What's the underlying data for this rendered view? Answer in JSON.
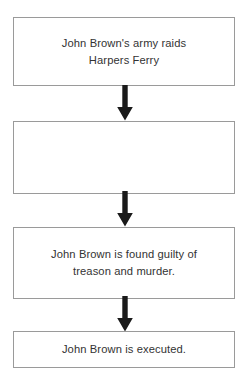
{
  "diagram": {
    "type": "vertical-flowchart",
    "orientation": "top-to-bottom",
    "background_color": "#ffffff",
    "box_border_color": "#9a9a9a",
    "text_color": "#333333",
    "arrow_color": "#1a1a1a",
    "nodes": [
      {
        "id": "node-1",
        "order": 1,
        "text": "John Brown's army raids\nHarpers Ferry",
        "empty": false
      },
      {
        "id": "node-2",
        "order": 2,
        "text": "",
        "empty": true
      },
      {
        "id": "node-3",
        "order": 3,
        "text": "John Brown is found guilty of\ntreason and murder.",
        "empty": false
      },
      {
        "id": "node-4",
        "order": 4,
        "text": "John Brown is executed.",
        "empty": false
      }
    ],
    "connectors": [
      {
        "id": "arrow-1",
        "from": "node-1",
        "to": "node-2",
        "icon": "arrow-down-icon"
      },
      {
        "id": "arrow-2",
        "from": "node-2",
        "to": "node-3",
        "icon": "arrow-down-icon"
      },
      {
        "id": "arrow-3",
        "from": "node-3",
        "to": "node-4",
        "icon": "arrow-down-icon"
      }
    ]
  }
}
